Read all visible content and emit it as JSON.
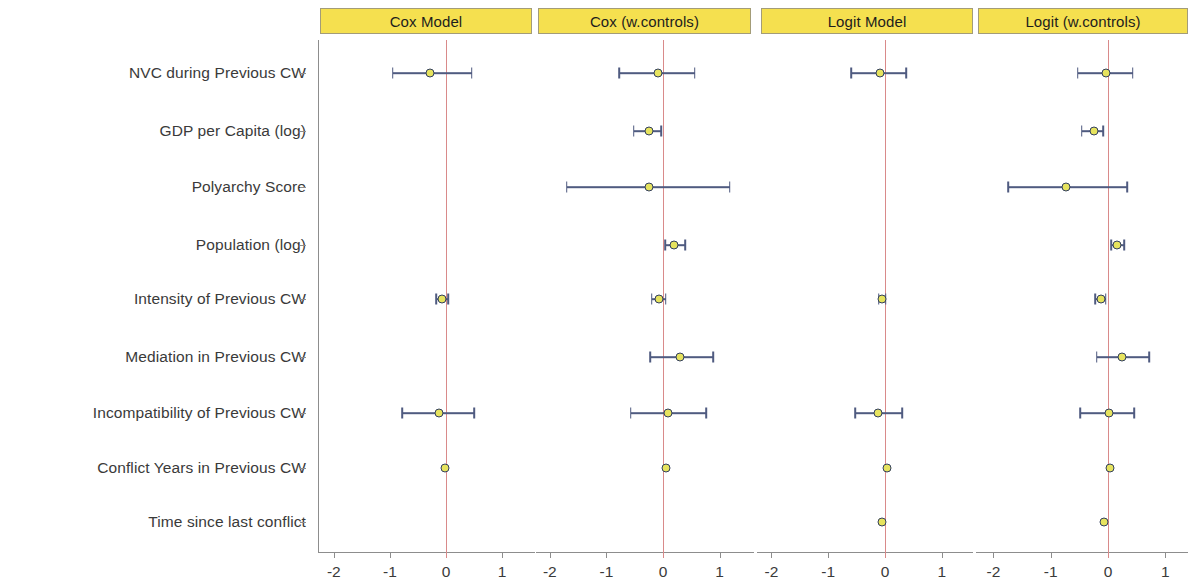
{
  "figure": {
    "type": "coefficient-plot",
    "marker_color": "#e6e35e",
    "marker_edge_color": "#33405e",
    "errorbar_color": "#4f5b80",
    "zero_line_color": "#d98a8a",
    "header_fill": "#f5e04f",
    "header_border": "#a39c78"
  },
  "rows": [
    {
      "label": "NVC during Previous CW"
    },
    {
      "label": "GDP per Capita (log)"
    },
    {
      "label": "Polyarchy Score"
    },
    {
      "label": "Population (log)"
    },
    {
      "label": "Intensity of Previous CW"
    },
    {
      "label": "Mediation in Previous CW"
    },
    {
      "label": "Incompatibility of Previous CW"
    },
    {
      "label": "Conflict Years in Previous CW"
    },
    {
      "label": "Time since last conflict"
    }
  ],
  "axis": {
    "ticks": [
      -2,
      -1,
      0,
      1
    ],
    "tick_labels": [
      "-2",
      "-1",
      "0",
      "1"
    ],
    "xlim": [
      -2.35,
      1.35
    ]
  },
  "panels": [
    {
      "title": "Cox Model"
    },
    {
      "title": "Cox (w.controls)"
    },
    {
      "title": "Logit Model"
    },
    {
      "title": "Logit (w.controls)"
    }
  ],
  "chart_data": {
    "type": "scatter",
    "title": "",
    "xlabel": "",
    "ylabel": "",
    "xlim": [
      -2.35,
      1.35
    ],
    "xticks": [
      -2,
      -1,
      0,
      1
    ],
    "grid": false,
    "legend": "none",
    "facets": [
      "Cox Model",
      "Cox (w.controls)",
      "Logit Model",
      "Logit (w.controls)"
    ],
    "categories": [
      "NVC during Previous CW",
      "GDP per Capita (log)",
      "Polyarchy Score",
      "Population (log)",
      "Intensity of Previous CW",
      "Mediation in Previous CW",
      "Incompatibility of Previous CW",
      "Conflict Years in Previous CW",
      "Time since last conflict"
    ],
    "series": [
      {
        "name": "Cox Model",
        "points": [
          {
            "category": "NVC during Previous CW",
            "estimate": -0.29,
            "low": -0.95,
            "high": 0.46
          },
          {
            "category": "GDP per Capita (log)",
            "estimate": null,
            "low": null,
            "high": null
          },
          {
            "category": "Polyarchy Score",
            "estimate": null,
            "low": null,
            "high": null
          },
          {
            "category": "Population (log)",
            "estimate": null,
            "low": null,
            "high": null
          },
          {
            "category": "Intensity of Previous CW",
            "estimate": -0.07,
            "low": -0.17,
            "high": 0.04
          },
          {
            "category": "Mediation in Previous CW",
            "estimate": null,
            "low": null,
            "high": null
          },
          {
            "category": "Incompatibility of Previous CW",
            "estimate": -0.13,
            "low": -0.78,
            "high": 0.5
          },
          {
            "category": "Conflict Years in Previous CW",
            "estimate": -0.01,
            "low": -0.01,
            "high": -0.01
          },
          {
            "category": "Time since last conflict",
            "estimate": null,
            "low": null,
            "high": null
          }
        ]
      },
      {
        "name": "Cox (w.controls)",
        "points": [
          {
            "category": "NVC during Previous CW",
            "estimate": -0.09,
            "low": -0.77,
            "high": 0.56
          },
          {
            "category": "GDP per Capita (log)",
            "estimate": -0.25,
            "low": -0.52,
            "high": -0.03
          },
          {
            "category": "Polyarchy Score",
            "estimate": -0.25,
            "low": -1.7,
            "high": 1.18
          },
          {
            "category": "Population (log)",
            "estimate": 0.2,
            "low": 0.04,
            "high": 0.39
          },
          {
            "category": "Intensity of Previous CW",
            "estimate": -0.07,
            "low": -0.2,
            "high": 0.05
          },
          {
            "category": "Mediation in Previous CW",
            "estimate": 0.3,
            "low": -0.23,
            "high": 0.89
          },
          {
            "category": "Incompatibility of Previous CW",
            "estimate": 0.09,
            "low": -0.57,
            "high": 0.76
          },
          {
            "category": "Conflict Years in Previous CW",
            "estimate": 0.05,
            "low": 0.05,
            "high": 0.05
          },
          {
            "category": "Time since last conflict",
            "estimate": null,
            "low": null,
            "high": null
          }
        ]
      },
      {
        "name": "Logit Model",
        "points": [
          {
            "category": "NVC during Previous CW",
            "estimate": -0.09,
            "low": -0.6,
            "high": 0.37
          },
          {
            "category": "GDP per Capita (log)",
            "estimate": null,
            "low": null,
            "high": null
          },
          {
            "category": "Polyarchy Score",
            "estimate": null,
            "low": null,
            "high": null
          },
          {
            "category": "Population (log)",
            "estimate": null,
            "low": null,
            "high": null
          },
          {
            "category": "Intensity of Previous CW",
            "estimate": -0.05,
            "low": -0.11,
            "high": 0.01
          },
          {
            "category": "Mediation in Previous CW",
            "estimate": null,
            "low": null,
            "high": null
          },
          {
            "category": "Incompatibility of Previous CW",
            "estimate": -0.12,
            "low": -0.52,
            "high": 0.3
          },
          {
            "category": "Conflict Years in Previous CW",
            "estimate": 0.04,
            "low": 0.04,
            "high": 0.04
          },
          {
            "category": "Time since last conflict",
            "estimate": -0.05,
            "low": -0.05,
            "high": -0.05
          }
        ]
      },
      {
        "name": "Logit (w.controls)",
        "points": [
          {
            "category": "NVC during Previous CW",
            "estimate": -0.04,
            "low": -0.53,
            "high": 0.43
          },
          {
            "category": "GDP per Capita (log)",
            "estimate": -0.25,
            "low": -0.46,
            "high": -0.08
          },
          {
            "category": "Polyarchy Score",
            "estimate": -0.73,
            "low": -1.74,
            "high": 0.34
          },
          {
            "category": "Population (log)",
            "estimate": 0.16,
            "low": 0.06,
            "high": 0.28
          },
          {
            "category": "Intensity of Previous CW",
            "estimate": -0.12,
            "low": -0.22,
            "high": -0.04
          },
          {
            "category": "Mediation in Previous CW",
            "estimate": 0.25,
            "low": -0.2,
            "high": 0.72
          },
          {
            "category": "Incompatibility of Previous CW",
            "estimate": 0.01,
            "low": -0.49,
            "high": 0.46
          },
          {
            "category": "Conflict Years in Previous CW",
            "estimate": 0.03,
            "low": 0.03,
            "high": 0.03
          },
          {
            "category": "Time since last conflict",
            "estimate": -0.07,
            "low": -0.07,
            "high": -0.07
          }
        ]
      }
    ]
  }
}
